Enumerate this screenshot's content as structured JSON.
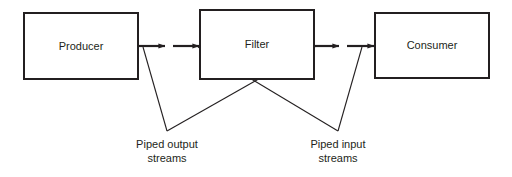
{
  "diagram": {
    "background_color": "#ffffff",
    "line_color": "#231f20",
    "nodes": [
      {
        "id": "producer",
        "label": "Producer",
        "x": 24,
        "y": 13,
        "w": 114,
        "h": 66
      },
      {
        "id": "filter",
        "label": "Filter",
        "x": 200,
        "y": 10,
        "w": 114,
        "h": 69
      },
      {
        "id": "consumer",
        "label": "Consumer",
        "x": 375,
        "y": 13,
        "w": 114,
        "h": 65
      }
    ],
    "arrows": [
      {
        "id": "producer-out",
        "from_x": 138,
        "from_y": 46,
        "to_x": 167,
        "to_y": 46
      },
      {
        "id": "filter-in",
        "from_x": 173,
        "from_y": 46,
        "to_x": 200,
        "to_y": 46
      },
      {
        "id": "filter-out",
        "from_x": 314,
        "from_y": 46,
        "to_x": 341,
        "to_y": 46
      },
      {
        "id": "consumer-in",
        "from_x": 347,
        "from_y": 46,
        "to_x": 375,
        "to_y": 46
      }
    ],
    "annotations": [
      {
        "id": "piped-output",
        "line1": "Piped output",
        "line2": "streams",
        "anchor_x": 167,
        "anchor_y": 131,
        "text_x": 167,
        "text_line1_y": 148,
        "text_line2_y": 162,
        "leaders": [
          {
            "x1": 143,
            "y1": 47,
            "x2": 167,
            "y2": 131
          },
          {
            "x1": 315,
            "y1": 47,
            "x2": 167,
            "y2": 131
          }
        ]
      },
      {
        "id": "piped-input",
        "line1": "Piped input",
        "line2": "streams",
        "anchor_x": 338,
        "anchor_y": 131,
        "text_x": 338,
        "text_line1_y": 148,
        "text_line2_y": 162,
        "leaders": [
          {
            "x1": 198,
            "y1": 47,
            "x2": 338,
            "y2": 131
          },
          {
            "x1": 362,
            "y1": 47,
            "x2": 338,
            "y2": 131
          }
        ]
      }
    ]
  }
}
